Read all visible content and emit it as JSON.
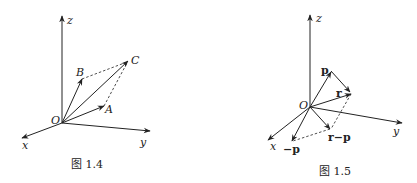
{
  "figure_1_4": {
    "caption": "图 1.4",
    "axes": {
      "x": "x",
      "y": "y",
      "z": "z"
    },
    "origin": "O",
    "points": {
      "A": "A",
      "B": "B",
      "C": "C"
    }
  },
  "figure_1_5": {
    "caption": "图 1.5",
    "axes": {
      "x": "x",
      "y": "y",
      "z": "z"
    },
    "origin": "O",
    "vectors": {
      "p": "p",
      "r": "r",
      "r_minus_p": "r−p",
      "neg_p": "−p"
    }
  },
  "colors": {
    "ink": "#222222",
    "background": "#ffffff"
  }
}
